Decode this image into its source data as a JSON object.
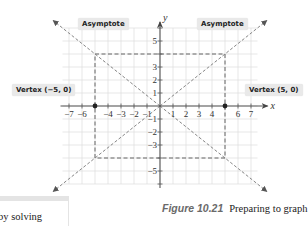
{
  "figure": {
    "label": "Figure 10.21",
    "caption_text": "Preparing to graph",
    "equation": {
      "term1": {
        "numerator_var": "x",
        "numerator_exp": "2",
        "denominator": "25"
      },
      "operator": "−",
      "term2": {
        "numerator_var": "y",
        "numerator_exp": "2",
        "denominator": "16"
      },
      "equals": "=",
      "rhs": "1"
    }
  },
  "callouts": {
    "asymptote_left": "Asymptote",
    "asymptote_right": "Asymptote",
    "vertex_left": "Vertex (−5, 0)",
    "vertex_right": "Vertex (5, 0)"
  },
  "side_note": {
    "text": "by solving"
  },
  "chart_data": {
    "type": "line",
    "title": "",
    "xlabel": "x",
    "ylabel": "y",
    "xlim": [
      -7.5,
      7.5
    ],
    "ylim": [
      -6,
      6
    ],
    "grid": true,
    "x_ticks": [
      -7,
      -6,
      -4,
      -3,
      -2,
      -1,
      1,
      2,
      3,
      4,
      6,
      7
    ],
    "y_ticks": [
      -5,
      -3,
      -2,
      -1,
      1,
      2,
      3,
      5
    ],
    "central_rectangle": {
      "x": [
        -5,
        5
      ],
      "y": [
        -4,
        4
      ],
      "style": "dashed"
    },
    "asymptotes": [
      {
        "name": "y = (4/5)x",
        "slope": 0.8,
        "style": "dashed-arrow"
      },
      {
        "name": "y = -(4/5)x",
        "slope": -0.8,
        "style": "dashed-arrow"
      }
    ],
    "vertices": [
      {
        "label": "Vertex (−5, 0)",
        "x": -5,
        "y": 0
      },
      {
        "label": "Vertex (5, 0)",
        "x": 5,
        "y": 0
      }
    ]
  },
  "colors": {
    "grid": "#dcdcdc",
    "axis": "#555555",
    "dashed": "#555555",
    "callout_bg": "#e9e9e9",
    "figure_label": "#6a6a6a"
  }
}
